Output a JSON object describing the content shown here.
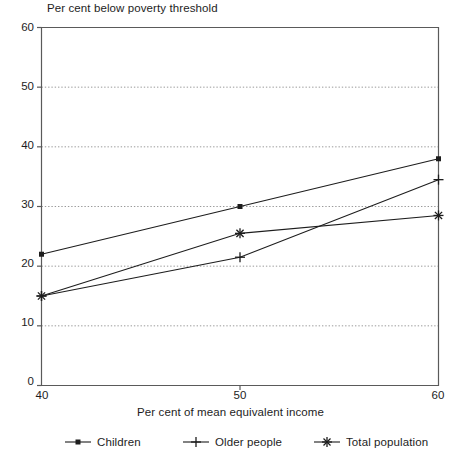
{
  "chart_data": {
    "type": "line",
    "title": "Per cent below poverty threshold",
    "xlabel": "Per cent of mean equivalent income",
    "ylabel": "",
    "xlim": [
      40,
      60
    ],
    "ylim": [
      0,
      60
    ],
    "xticks": [
      40,
      50,
      60
    ],
    "yticks": [
      0,
      10,
      20,
      30,
      40,
      50,
      60
    ],
    "xtick_labels": [
      "40",
      "50",
      "60"
    ],
    "ytick_labels": [
      "0",
      "10",
      "20",
      "30",
      "40",
      "50",
      "60"
    ],
    "grid": "horizontal-dotted",
    "legend_position": "bottom",
    "x": [
      40,
      50,
      60
    ],
    "series": [
      {
        "name": "Children",
        "marker": "square-dot",
        "values": [
          22,
          30,
          38
        ]
      },
      {
        "name": "Older people",
        "marker": "plus",
        "values": [
          15,
          21.5,
          34.5
        ]
      },
      {
        "name": "Total population",
        "marker": "asterisk",
        "values": [
          15,
          25.5,
          28.5
        ]
      }
    ],
    "colors": {
      "line": "#1d1d1d",
      "grid": "#9a9a9a",
      "axis": "#5a5a5a"
    }
  },
  "legend": {
    "items": [
      {
        "label": "Children"
      },
      {
        "label": "Older people"
      },
      {
        "label": "Total population"
      }
    ]
  }
}
